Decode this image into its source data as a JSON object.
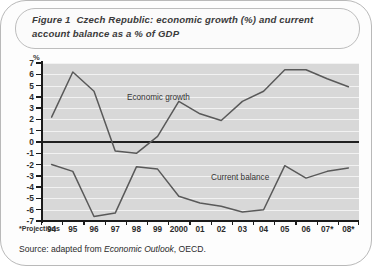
{
  "figure": {
    "label": "Figure 1",
    "title": "Czech Republic: economic growth (%) and current account balance as a % of GDP",
    "y_unit": "%",
    "footnote": "*Projections",
    "source_prefix": "Source: adapted from ",
    "source_italic": "Economic Outlook",
    "source_suffix": ", OECD."
  },
  "chart_data": {
    "type": "line",
    "title": "Czech Republic: economic growth (%) and current account balance as a % of GDP",
    "xlabel": "",
    "ylabel": "%",
    "ylim": [
      -7,
      7
    ],
    "ytick_step": 1,
    "yticks": [
      7,
      6,
      5,
      4,
      3,
      2,
      1,
      0,
      -1,
      -2,
      -3,
      -4,
      -5,
      -6,
      -7
    ],
    "ytick_labels": [
      "7",
      "6",
      "5",
      "4",
      "3",
      "2",
      "1",
      "0",
      "-1",
      "-2",
      "-3",
      "-4",
      "-5",
      "-6",
      "-7"
    ],
    "grid": true,
    "legend": "inline-annotations",
    "categories": [
      "94",
      "95",
      "96",
      "97",
      "98",
      "99",
      "2000",
      "01",
      "02",
      "03",
      "04",
      "05",
      "06",
      "07*",
      "08*"
    ],
    "series": [
      {
        "name": "Economic growth",
        "color": "#595959",
        "values": [
          2.2,
          6.2,
          4.5,
          -0.8,
          -1.0,
          0.5,
          3.6,
          2.5,
          1.9,
          3.6,
          4.5,
          6.4,
          6.4,
          5.6,
          4.9
        ]
      },
      {
        "name": "Current balance",
        "color": "#595959",
        "values": [
          -2.0,
          -2.6,
          -6.6,
          -6.3,
          -2.2,
          -2.4,
          -4.8,
          -5.4,
          -5.7,
          -6.2,
          -6.0,
          -2.1,
          -3.2,
          -2.6,
          -2.3
        ]
      }
    ],
    "annotations": [
      {
        "text": "Economic growth",
        "series": "Economic growth"
      },
      {
        "text": "Current balance",
        "series": "Current balance"
      }
    ]
  }
}
